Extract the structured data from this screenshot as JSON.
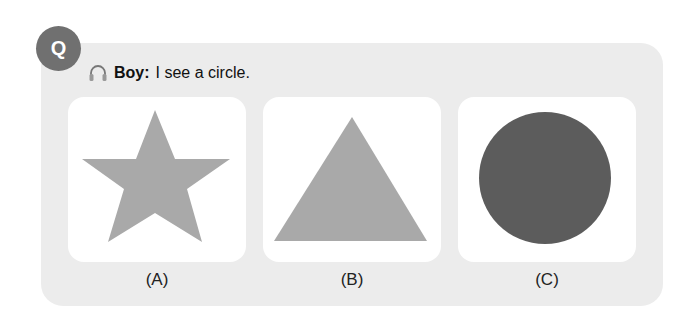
{
  "question": {
    "badge": "Q",
    "audio_icon": "headphones-icon",
    "speaker": "Boy:",
    "text": "I see a circle."
  },
  "options": [
    {
      "label": "(A)",
      "shape": "star",
      "color": "#a9a9a9"
    },
    {
      "label": "(B)",
      "shape": "triangle",
      "color": "#a9a9a9"
    },
    {
      "label": "(C)",
      "shape": "circle",
      "color": "#5c5c5c"
    }
  ],
  "colors": {
    "panel": "#ececec",
    "badge": "#707070",
    "card": "#ffffff"
  }
}
